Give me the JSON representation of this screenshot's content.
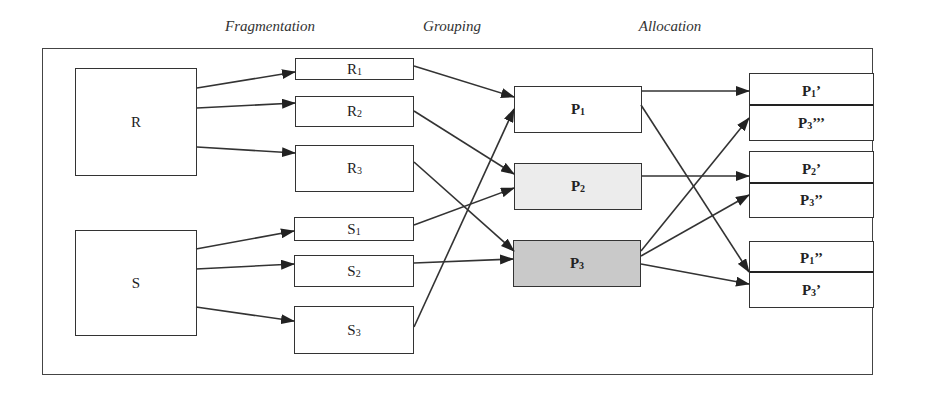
{
  "stages": {
    "fragmentation": "Fragmentation",
    "grouping": "Grouping",
    "allocation": "Allocation"
  },
  "relations": {
    "r": "R",
    "s": "S"
  },
  "fragments": {
    "r1": {
      "base": "R",
      "sub": "1"
    },
    "r2": {
      "base": "R",
      "sub": "2"
    },
    "r3": {
      "base": "R",
      "sub": "3"
    },
    "s1": {
      "base": "S",
      "sub": "1"
    },
    "s2": {
      "base": "S",
      "sub": "2"
    },
    "s3": {
      "base": "S",
      "sub": "3"
    }
  },
  "groups": {
    "p1": {
      "base": "P",
      "sub": "1",
      "fill": "#ffffff"
    },
    "p2": {
      "base": "P",
      "sub": "2",
      "fill": "#ececec"
    },
    "p3": {
      "base": "P",
      "sub": "3",
      "fill": "#c9c9c9"
    }
  },
  "allocations": [
    {
      "top": {
        "base": "P",
        "sub": "1",
        "prime": "’"
      },
      "bottom": {
        "base": "P",
        "sub": "3",
        "prime": "’’’"
      }
    },
    {
      "top": {
        "base": "P",
        "sub": "2",
        "prime": "’"
      },
      "bottom": {
        "base": "P",
        "sub": "3",
        "prime": "’’"
      }
    },
    {
      "top": {
        "base": "P",
        "sub": "1",
        "prime": "’’"
      },
      "bottom": {
        "base": "P",
        "sub": "3",
        "prime": "’"
      }
    }
  ],
  "edges": [
    [
      "R",
      "R1"
    ],
    [
      "R",
      "R2"
    ],
    [
      "R",
      "R3"
    ],
    [
      "S",
      "S1"
    ],
    [
      "S",
      "S2"
    ],
    [
      "S",
      "S3"
    ],
    [
      "R1",
      "P1"
    ],
    [
      "R2",
      "P2"
    ],
    [
      "R3",
      "P3"
    ],
    [
      "S1",
      "P2"
    ],
    [
      "S2",
      "P3"
    ],
    [
      "S3",
      "P1"
    ],
    [
      "P1",
      "P1'"
    ],
    [
      "P1",
      "P1''"
    ],
    [
      "P2",
      "P2'"
    ],
    [
      "P3",
      "P3'''"
    ],
    [
      "P3",
      "P3''"
    ],
    [
      "P3",
      "P3'"
    ]
  ]
}
